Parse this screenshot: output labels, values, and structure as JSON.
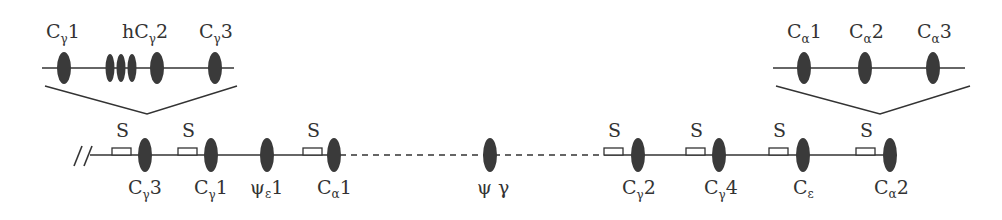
{
  "diagram": {
    "colors": {
      "gene": "#3a3a3a",
      "line": "#333333",
      "background": "#ffffff"
    },
    "main_locus": {
      "break_symbol": "//",
      "switch_label": "S",
      "genes": [
        {
          "id": "cg3",
          "base": "C",
          "sub": "γ",
          "suffix": "3",
          "x": 145,
          "switch": true
        },
        {
          "id": "cg1",
          "base": "C",
          "sub": "γ",
          "suffix": "1",
          "x": 211,
          "switch": true
        },
        {
          "id": "pe1",
          "base": "ψ",
          "sub": "ε",
          "suffix": "1",
          "x": 267,
          "switch": false
        },
        {
          "id": "ca1",
          "base": "C",
          "sub": "α",
          "suffix": "1",
          "x": 333,
          "switch": true
        },
        {
          "id": "pg",
          "base": "ψ γ",
          "sub": "",
          "suffix": "",
          "x": 490,
          "switch": false
        },
        {
          "id": "cg2",
          "base": "C",
          "sub": "γ",
          "suffix": "2",
          "x": 638,
          "switch": true
        },
        {
          "id": "cg4",
          "base": "C",
          "sub": "γ",
          "suffix": "4",
          "x": 719,
          "switch": true
        },
        {
          "id": "ce",
          "base": "C",
          "sub": "ε",
          "suffix": "",
          "x": 803,
          "switch": true
        },
        {
          "id": "ca2",
          "base": "C",
          "sub": "α",
          "suffix": "2",
          "x": 890,
          "switch": true
        }
      ],
      "segments": [
        {
          "style": "solid",
          "from": 80,
          "to": 340
        },
        {
          "style": "dashed",
          "from": 340,
          "to": 605
        },
        {
          "style": "solid",
          "from": 605,
          "to": 890
        }
      ]
    },
    "insets": [
      {
        "id": "left-inset",
        "expands_gene": "cg3",
        "labels": [
          {
            "text_base": "C",
            "sub": "γ",
            "suffix": "1",
            "x": 64
          },
          {
            "text_base": "hC",
            "sub": "γ",
            "suffix": "2",
            "x": 145
          },
          {
            "text_base": "C",
            "sub": "γ",
            "suffix": "3",
            "x": 214
          }
        ]
      },
      {
        "id": "right-inset",
        "expands_gene": "ca2",
        "labels": [
          {
            "text_base": "C",
            "sub": "α",
            "suffix": "1",
            "x": 805
          },
          {
            "text_base": "C",
            "sub": "α",
            "suffix": "2",
            "x": 866
          },
          {
            "text_base": "C",
            "sub": "α",
            "suffix": "3",
            "x": 934
          }
        ]
      }
    ]
  }
}
